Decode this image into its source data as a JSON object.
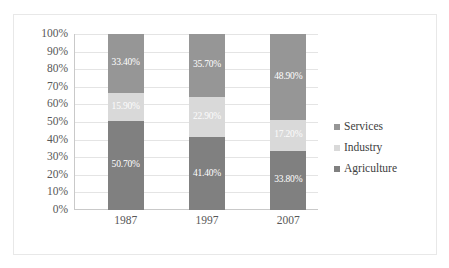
{
  "chart_data": {
    "type": "bar",
    "stacked": true,
    "title": "",
    "subtitle": "",
    "xlabel": "",
    "ylabel": "",
    "categories": [
      "1987",
      "1997",
      "2007"
    ],
    "ylim": [
      0,
      100
    ],
    "ytick_labels": [
      "100%",
      "90%",
      "80%",
      "70%",
      "60%",
      "50%",
      "40%",
      "30%",
      "20%",
      "10%",
      "0%"
    ],
    "ytick_values": [
      100,
      90,
      80,
      70,
      60,
      50,
      40,
      30,
      20,
      10,
      0
    ],
    "grid": true,
    "legend_position": "right",
    "series": [
      {
        "name": "Agriculture",
        "color": "#808080",
        "values": [
          50.7,
          41.4,
          33.8
        ],
        "labels": [
          "50.70%",
          "41.40%",
          "33.80%"
        ]
      },
      {
        "name": "Industry",
        "color": "#d9d9d9",
        "values": [
          15.9,
          22.9,
          17.2
        ],
        "labels": [
          "15.90%",
          "22.90%",
          "17.20%"
        ]
      },
      {
        "name": "Services",
        "color": "#969696",
        "values": [
          33.4,
          35.7,
          48.9
        ],
        "labels": [
          "33.40%",
          "35.70%",
          "48.90%"
        ]
      }
    ]
  },
  "legend": {
    "items": [
      {
        "label": "Services",
        "color": "#969696",
        "marker": "square-marker"
      },
      {
        "label": "Industry",
        "color": "#d9d9d9",
        "marker": "square-marker"
      },
      {
        "label": "Agriculture",
        "color": "#808080",
        "marker": "square-marker"
      }
    ]
  },
  "colors": {
    "agriculture": "#808080",
    "industry": "#d9d9d9",
    "services": "#969696",
    "gridline": "#e4e4e4",
    "axis": "#c9c9c9",
    "frame_border": "#e8e8e8",
    "tick_text": "#585858",
    "legend_text": "#404040",
    "data_label_text": "#ffffff",
    "plot_background": "#ffffff"
  }
}
